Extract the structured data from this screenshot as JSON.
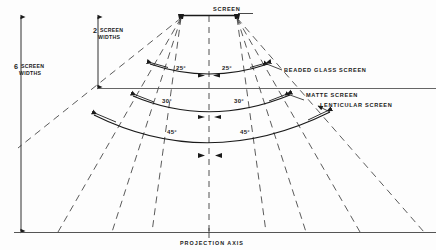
{
  "figure": {
    "title_label": "SCREEN",
    "axis_label": "PROJECTION AXIS",
    "dimension_left": {
      "number": "6",
      "unit_line1": "SCREEN",
      "unit_line2": "WIDTHS",
      "text": "6 SCREEN WIDTHS"
    },
    "dimension_mid": {
      "number": "2",
      "unit_line1": "SCREEN",
      "unit_line2": "WIDTHS",
      "text": "2 SCREEN WIDTHS"
    },
    "screen_types": [
      {
        "name": "BEADED GLASS SCREEN",
        "angle_left": "25°",
        "angle_right": "25°",
        "half_angle_deg": 25
      },
      {
        "name": "MATTE SCREEN",
        "angle_left": "30°",
        "angle_right": "30°",
        "half_angle_deg": 30
      },
      {
        "name": "LENTICULAR SCREEN",
        "angle_left": "45°",
        "angle_right": "45°",
        "half_angle_deg": 45
      }
    ],
    "colors": {
      "ink": "#1a1a1a",
      "line": "#2b2b2b",
      "dashed": "#3d3d3d",
      "background": "#fdfdfd"
    }
  }
}
